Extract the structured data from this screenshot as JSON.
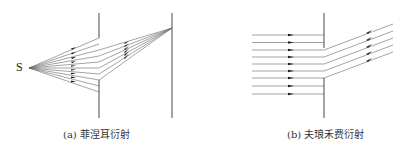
{
  "panels": [
    {
      "id": "a",
      "caption": "(a) 菲涅耳衍射",
      "source_label": "S",
      "type": "fresnel",
      "ray_count": 9,
      "screens": [
        "aperture-screen",
        "observation-screen"
      ]
    },
    {
      "id": "b",
      "caption": "(b) 夫琅禾费衍射",
      "type": "fraunhofer",
      "ray_count": 9,
      "diffracted_ray_count": 5,
      "screens": [
        "aperture-screen"
      ]
    }
  ],
  "colors": {
    "line": "#555555",
    "screen": "#666666",
    "arrow": "#222222"
  }
}
